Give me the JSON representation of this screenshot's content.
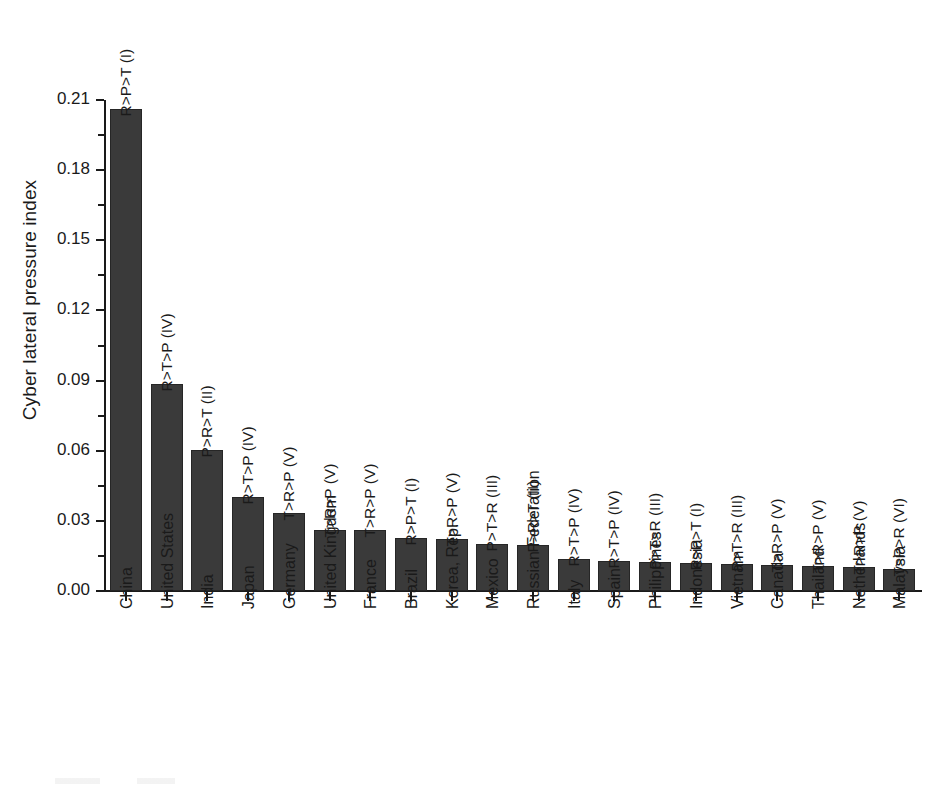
{
  "chart_data": {
    "type": "bar",
    "title": "",
    "xlabel": "",
    "ylabel": "Cyber lateral pressure index",
    "ylim": [
      0.0,
      0.21
    ],
    "grid": false,
    "legend": "none",
    "ytick_labels": [
      "0.00",
      "0.03",
      "0.06",
      "0.09",
      "0.12",
      "0.15",
      "0.18",
      "0.21"
    ],
    "ytick_values": [
      0.0,
      0.03,
      0.06,
      0.09,
      0.12,
      0.15,
      0.18,
      0.21
    ],
    "categories": [
      "China",
      "United States",
      "India",
      "Japan",
      "Germany",
      "United Kingdom",
      "France",
      "Brazil",
      "Korea, Rep.",
      "Mexico",
      "Russian Federation",
      "Italy",
      "Spain",
      "Philippines",
      "Indonesia",
      "Vietnam",
      "Canada",
      "Thailand",
      "Netherlands",
      "Malaysia"
    ],
    "values": [
      0.206,
      0.0885,
      0.0602,
      0.04,
      0.0334,
      0.0263,
      0.0259,
      0.0228,
      0.0222,
      0.0202,
      0.0198,
      0.0137,
      0.013,
      0.0122,
      0.0119,
      0.0117,
      0.0113,
      0.0107,
      0.0103,
      0.0094
    ],
    "point_labels": [
      "R>P>T (I)",
      "R>T>P (IV)",
      "P>R>T (II)",
      "R>T>P (IV)",
      "T>R>P (V)",
      "T>R>P (V)",
      "T>R>P (V)",
      "R>P>T (I)",
      "T>R>P (V)",
      "P>T>R (III)",
      "P>R>T (II)",
      "R>T>P (IV)",
      "R>T>P (IV)",
      "P>T>R (III)",
      "R>P>T (I)",
      "P>T>R (III)",
      "T>R>P (V)",
      "T>R>P (V)",
      "T>R>P (V)",
      "T>P>R (VI)"
    ],
    "bar_color": "#3a3a3a",
    "bar_edge_color": "#262626",
    "axis_color": "#1a1a1a",
    "background_color": "#ffffff"
  }
}
